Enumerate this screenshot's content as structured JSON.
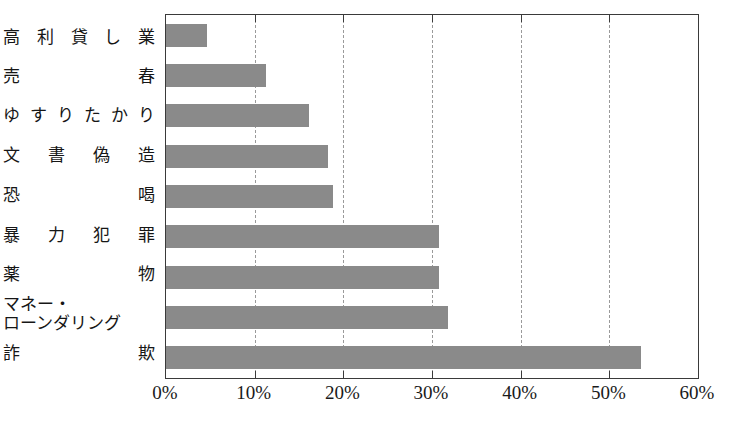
{
  "chart_data": {
    "type": "bar",
    "orientation": "horizontal",
    "title": "",
    "subtitle": "",
    "xlabel": "",
    "ylabel": "",
    "categories": [
      "高利貸し業",
      "売春",
      "ゆすりたかり",
      "文書偽造",
      "恐喝",
      "暴力犯罪",
      "薬物",
      "マネー・ローンダリング",
      "詐欺"
    ],
    "category_lines": [
      [
        "高利貸し業"
      ],
      [
        "売春"
      ],
      [
        "ゆすりたかり"
      ],
      [
        "文書偽造"
      ],
      [
        "恐喝"
      ],
      [
        "暴力犯罪"
      ],
      [
        "薬物"
      ],
      [
        "マネー・",
        "ローンダリング"
      ],
      [
        "詐欺"
      ]
    ],
    "values": [
      4.6,
      11.3,
      16.1,
      18.3,
      18.8,
      30.8,
      30.8,
      31.8,
      53.6
    ],
    "value_unit": "%",
    "xlim": [
      0,
      60
    ],
    "xticks": [
      0,
      10,
      20,
      30,
      40,
      50,
      60
    ],
    "xtick_labels": [
      "0%",
      "10%",
      "20%",
      "30%",
      "40%",
      "50%",
      "60%"
    ],
    "grid": true,
    "grid_axis": "x",
    "grid_style": "dashed",
    "legend": false,
    "legend_position": "none",
    "colors": {
      "bar": "#8a8a8a",
      "frame": "#3a3a3a",
      "grid": "#9a9a9a",
      "text": "#1a1a1a",
      "background": "#ffffff"
    }
  }
}
